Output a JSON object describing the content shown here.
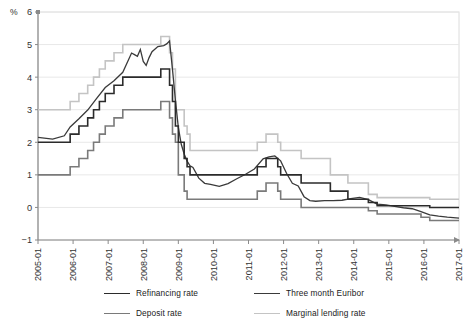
{
  "chart_data": {
    "type": "line",
    "title": "",
    "xlabel": "",
    "ylabel": "%",
    "ylim": [
      -1,
      6
    ],
    "yticks": [
      -1,
      0,
      1,
      2,
      3,
      4,
      5,
      6
    ],
    "grid": true,
    "legend_position": "bottom",
    "xlim": [
      "2005-01",
      "2017-01"
    ],
    "xticks": [
      "2005-01",
      "2006-01",
      "2007-01",
      "2008-01",
      "2009-01",
      "2010-01",
      "2011-01",
      "2012-01",
      "2013-01",
      "2014-01",
      "2015-01",
      "2016-01",
      "2017-01"
    ],
    "series": [
      {
        "name": "Refinancing rate",
        "color": "#2b2b2b",
        "width": 1.6,
        "points": [
          [
            "2005-01",
            2.0
          ],
          [
            "2005-12",
            2.0
          ],
          [
            "2005-12",
            2.25
          ],
          [
            "2006-03",
            2.25
          ],
          [
            "2006-03",
            2.5
          ],
          [
            "2006-06",
            2.5
          ],
          [
            "2006-06",
            2.75
          ],
          [
            "2006-08",
            2.75
          ],
          [
            "2006-08",
            3.0
          ],
          [
            "2006-10",
            3.0
          ],
          [
            "2006-10",
            3.25
          ],
          [
            "2006-12",
            3.25
          ],
          [
            "2006-12",
            3.5
          ],
          [
            "2007-03",
            3.5
          ],
          [
            "2007-03",
            3.75
          ],
          [
            "2007-06",
            3.75
          ],
          [
            "2007-06",
            4.0
          ],
          [
            "2008-07",
            4.0
          ],
          [
            "2008-07",
            4.25
          ],
          [
            "2008-10",
            4.25
          ],
          [
            "2008-10",
            3.75
          ],
          [
            "2008-11",
            3.75
          ],
          [
            "2008-11",
            3.25
          ],
          [
            "2008-12",
            3.25
          ],
          [
            "2008-12",
            2.5
          ],
          [
            "2009-01",
            2.5
          ],
          [
            "2009-01",
            2.0
          ],
          [
            "2009-03",
            2.0
          ],
          [
            "2009-03",
            1.5
          ],
          [
            "2009-04",
            1.5
          ],
          [
            "2009-04",
            1.25
          ],
          [
            "2009-05",
            1.25
          ],
          [
            "2009-05",
            1.0
          ],
          [
            "2011-04",
            1.0
          ],
          [
            "2011-04",
            1.25
          ],
          [
            "2011-07",
            1.25
          ],
          [
            "2011-07",
            1.5
          ],
          [
            "2011-11",
            1.5
          ],
          [
            "2011-11",
            1.25
          ],
          [
            "2011-12",
            1.25
          ],
          [
            "2011-12",
            1.0
          ],
          [
            "2012-07",
            1.0
          ],
          [
            "2012-07",
            0.75
          ],
          [
            "2013-05",
            0.75
          ],
          [
            "2013-05",
            0.5
          ],
          [
            "2013-11",
            0.5
          ],
          [
            "2013-11",
            0.25
          ],
          [
            "2014-06",
            0.25
          ],
          [
            "2014-06",
            0.15
          ],
          [
            "2014-09",
            0.15
          ],
          [
            "2014-09",
            0.05
          ],
          [
            "2016-03",
            0.05
          ],
          [
            "2016-03",
            0.0
          ],
          [
            "2017-01",
            0.0
          ]
        ]
      },
      {
        "name": "Three month Euribor",
        "color": "#3a3a3a",
        "width": 1.3,
        "points": [
          [
            "2005-01",
            2.15
          ],
          [
            "2005-06",
            2.1
          ],
          [
            "2005-10",
            2.2
          ],
          [
            "2005-12",
            2.47
          ],
          [
            "2006-03",
            2.72
          ],
          [
            "2006-06",
            2.99
          ],
          [
            "2006-09",
            3.34
          ],
          [
            "2006-12",
            3.68
          ],
          [
            "2007-03",
            3.89
          ],
          [
            "2007-06",
            4.15
          ],
          [
            "2007-09",
            4.74
          ],
          [
            "2007-10",
            4.69
          ],
          [
            "2007-11",
            4.64
          ],
          [
            "2007-12",
            4.85
          ],
          [
            "2008-01",
            4.48
          ],
          [
            "2008-02",
            4.36
          ],
          [
            "2008-03",
            4.6
          ],
          [
            "2008-04",
            4.78
          ],
          [
            "2008-06",
            4.94
          ],
          [
            "2008-08",
            4.97
          ],
          [
            "2008-09",
            5.02
          ],
          [
            "2008-10",
            5.11
          ],
          [
            "2008-11",
            4.24
          ],
          [
            "2008-12",
            3.29
          ],
          [
            "2009-01",
            2.46
          ],
          [
            "2009-02",
            1.94
          ],
          [
            "2009-03",
            1.64
          ],
          [
            "2009-04",
            1.42
          ],
          [
            "2009-05",
            1.28
          ],
          [
            "2009-06",
            1.23
          ],
          [
            "2009-08",
            0.9
          ],
          [
            "2009-10",
            0.74
          ],
          [
            "2009-12",
            0.71
          ],
          [
            "2010-03",
            0.65
          ],
          [
            "2010-06",
            0.73
          ],
          [
            "2010-09",
            0.88
          ],
          [
            "2010-12",
            1.02
          ],
          [
            "2011-03",
            1.18
          ],
          [
            "2011-06",
            1.49
          ],
          [
            "2011-08",
            1.55
          ],
          [
            "2011-10",
            1.58
          ],
          [
            "2011-12",
            1.43
          ],
          [
            "2012-02",
            1.05
          ],
          [
            "2012-04",
            0.74
          ],
          [
            "2012-06",
            0.66
          ],
          [
            "2012-08",
            0.33
          ],
          [
            "2012-10",
            0.21
          ],
          [
            "2012-12",
            0.19
          ],
          [
            "2013-03",
            0.21
          ],
          [
            "2013-06",
            0.21
          ],
          [
            "2013-09",
            0.22
          ],
          [
            "2013-12",
            0.27
          ],
          [
            "2014-03",
            0.31
          ],
          [
            "2014-06",
            0.24
          ],
          [
            "2014-09",
            0.1
          ],
          [
            "2014-12",
            0.08
          ],
          [
            "2015-03",
            0.03
          ],
          [
            "2015-06",
            -0.01
          ],
          [
            "2015-09",
            -0.04
          ],
          [
            "2015-12",
            -0.13
          ],
          [
            "2016-03",
            -0.23
          ],
          [
            "2016-06",
            -0.27
          ],
          [
            "2016-09",
            -0.3
          ],
          [
            "2016-12",
            -0.32
          ],
          [
            "2017-01",
            -0.33
          ]
        ]
      },
      {
        "name": "Deposit rate",
        "color": "#7a7a7a",
        "width": 1.6,
        "points": [
          [
            "2005-01",
            1.0
          ],
          [
            "2005-12",
            1.0
          ],
          [
            "2005-12",
            1.25
          ],
          [
            "2006-03",
            1.25
          ],
          [
            "2006-03",
            1.5
          ],
          [
            "2006-06",
            1.5
          ],
          [
            "2006-06",
            1.75
          ],
          [
            "2006-08",
            1.75
          ],
          [
            "2006-08",
            2.0
          ],
          [
            "2006-10",
            2.0
          ],
          [
            "2006-10",
            2.25
          ],
          [
            "2006-12",
            2.25
          ],
          [
            "2006-12",
            2.5
          ],
          [
            "2007-03",
            2.5
          ],
          [
            "2007-03",
            2.75
          ],
          [
            "2007-06",
            2.75
          ],
          [
            "2007-06",
            3.0
          ],
          [
            "2008-07",
            3.0
          ],
          [
            "2008-07",
            3.25
          ],
          [
            "2008-10",
            3.25
          ],
          [
            "2008-10",
            2.75
          ],
          [
            "2008-11",
            2.75
          ],
          [
            "2008-11",
            2.25
          ],
          [
            "2008-12",
            2.25
          ],
          [
            "2008-12",
            2.0
          ],
          [
            "2009-01",
            2.0
          ],
          [
            "2009-01",
            1.0
          ],
          [
            "2009-03",
            1.0
          ],
          [
            "2009-03",
            0.5
          ],
          [
            "2009-04",
            0.5
          ],
          [
            "2009-04",
            0.25
          ],
          [
            "2011-04",
            0.25
          ],
          [
            "2011-04",
            0.5
          ],
          [
            "2011-07",
            0.5
          ],
          [
            "2011-07",
            0.75
          ],
          [
            "2011-11",
            0.75
          ],
          [
            "2011-11",
            0.5
          ],
          [
            "2011-12",
            0.5
          ],
          [
            "2011-12",
            0.25
          ],
          [
            "2012-07",
            0.25
          ],
          [
            "2012-07",
            0.0
          ],
          [
            "2014-06",
            0.0
          ],
          [
            "2014-06",
            -0.1
          ],
          [
            "2014-09",
            -0.1
          ],
          [
            "2014-09",
            -0.2
          ],
          [
            "2015-12",
            -0.2
          ],
          [
            "2015-12",
            -0.3
          ],
          [
            "2016-03",
            -0.3
          ],
          [
            "2016-03",
            -0.4
          ],
          [
            "2017-01",
            -0.4
          ]
        ]
      },
      {
        "name": "Marginal lending rate",
        "color": "#c4c4c4",
        "width": 1.6,
        "points": [
          [
            "2005-01",
            3.0
          ],
          [
            "2005-12",
            3.0
          ],
          [
            "2005-12",
            3.25
          ],
          [
            "2006-03",
            3.25
          ],
          [
            "2006-03",
            3.5
          ],
          [
            "2006-06",
            3.5
          ],
          [
            "2006-06",
            3.75
          ],
          [
            "2006-08",
            3.75
          ],
          [
            "2006-08",
            4.0
          ],
          [
            "2006-10",
            4.0
          ],
          [
            "2006-10",
            4.25
          ],
          [
            "2006-12",
            4.25
          ],
          [
            "2006-12",
            4.5
          ],
          [
            "2007-03",
            4.5
          ],
          [
            "2007-03",
            4.75
          ],
          [
            "2007-06",
            4.75
          ],
          [
            "2007-06",
            5.0
          ],
          [
            "2008-07",
            5.0
          ],
          [
            "2008-07",
            5.25
          ],
          [
            "2008-10",
            5.25
          ],
          [
            "2008-10",
            4.75
          ],
          [
            "2008-11",
            4.75
          ],
          [
            "2008-11",
            4.25
          ],
          [
            "2008-12",
            4.25
          ],
          [
            "2008-12",
            3.0
          ],
          [
            "2009-01",
            3.0
          ],
          [
            "2009-01",
            3.0
          ],
          [
            "2009-03",
            3.0
          ],
          [
            "2009-03",
            2.5
          ],
          [
            "2009-04",
            2.5
          ],
          [
            "2009-04",
            2.25
          ],
          [
            "2009-05",
            2.25
          ],
          [
            "2009-05",
            1.75
          ],
          [
            "2011-04",
            1.75
          ],
          [
            "2011-04",
            2.0
          ],
          [
            "2011-07",
            2.0
          ],
          [
            "2011-07",
            2.25
          ],
          [
            "2011-11",
            2.25
          ],
          [
            "2011-11",
            2.0
          ],
          [
            "2011-12",
            2.0
          ],
          [
            "2011-12",
            1.75
          ],
          [
            "2012-07",
            1.75
          ],
          [
            "2012-07",
            1.5
          ],
          [
            "2013-05",
            1.5
          ],
          [
            "2013-05",
            1.0
          ],
          [
            "2013-11",
            1.0
          ],
          [
            "2013-11",
            0.75
          ],
          [
            "2014-06",
            0.75
          ],
          [
            "2014-06",
            0.4
          ],
          [
            "2014-09",
            0.4
          ],
          [
            "2014-09",
            0.3
          ],
          [
            "2016-03",
            0.3
          ],
          [
            "2016-03",
            0.25
          ],
          [
            "2017-01",
            0.25
          ]
        ]
      }
    ]
  },
  "legend": {
    "items": [
      {
        "label": "Refinancing rate",
        "color": "#2b2b2b",
        "width": "1.8px"
      },
      {
        "label": "Three month Euribor",
        "color": "#3a3a3a",
        "width": "1.5px"
      },
      {
        "label": "Deposit rate",
        "color": "#7a7a7a",
        "width": "1.8px"
      },
      {
        "label": "Marginal lending rate",
        "color": "#c4c4c4",
        "width": "1.8px"
      }
    ]
  },
  "axes": {
    "y_unit_label": "%",
    "y_tick_labels": [
      "6",
      "5",
      "4",
      "3",
      "2",
      "1",
      "0",
      "-1"
    ],
    "x_tick_labels": [
      "2005-01",
      "2006-01",
      "2007-01",
      "2008-01",
      "2009-01",
      "2010-01",
      "2011-01",
      "2012-01",
      "2013-01",
      "2014-01",
      "2015-01",
      "2016-01",
      "2017-01"
    ]
  },
  "colors": {
    "grid": "#e8e8e8",
    "axis": "#8a8a8a",
    "frame": "#dcdcdc",
    "text": "#333333"
  }
}
